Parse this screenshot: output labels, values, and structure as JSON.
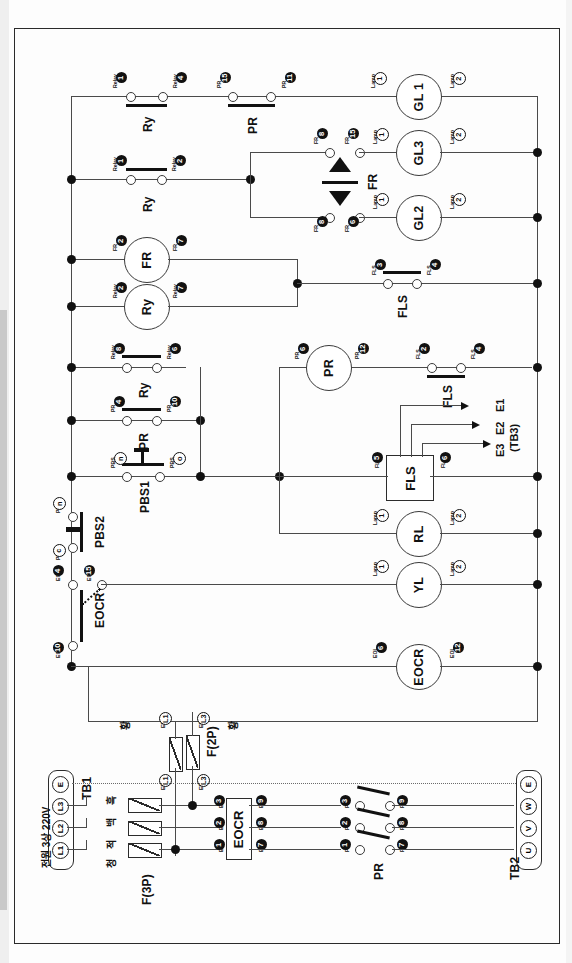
{
  "diagram": {
    "orientation": "page printed sideways (rotated 90 degrees)",
    "supply_label": "전원 3상 220V",
    "terminal_blocks": {
      "tb1": {
        "name": "TB1",
        "terminals": [
          "E",
          "L3",
          "L2",
          "L1"
        ]
      },
      "tb2": {
        "name": "TB2",
        "terminals": [
          "E",
          "W",
          "V",
          "U"
        ]
      },
      "tb3": {
        "name": "(TB3)",
        "electrodes": [
          "E1",
          "E2",
          "E3"
        ]
      }
    },
    "fuses": {
      "three_pole": {
        "label": "F(3P)",
        "wire_colors": [
          "흑",
          "백",
          "적",
          "청"
        ]
      },
      "two_pole": {
        "label": "F(2P)",
        "in_left": "EFin L1",
        "out_left": "EFout L1",
        "in_right": "EFin L3",
        "out_right": "EFout L3",
        "color_left": "황",
        "color_right": "황"
      }
    },
    "devices": {
      "eocr_box": "EOCR",
      "eocr_coil": "EOCR",
      "fls_box": "FLS",
      "pr_coil": "PR",
      "fr_coil": "FR",
      "ry_coil": "Ry",
      "rl_lamp": "RL",
      "yl_lamp": "YL",
      "gl1_lamp": "GL 1",
      "gl2_lamp": "GL2",
      "gl3_lamp": "GL3",
      "pbs1": "PBS1",
      "pbs2": "PBS2",
      "fr_flicker": "FR"
    },
    "rows": [
      {
        "id": "row-gl1",
        "contacts": [
          {
            "device": "Ry",
            "caption_a": "Relay",
            "num_a": "1",
            "caption_b": "Relay",
            "num_b": "4",
            "type": "nc"
          },
          {
            "device": "PR",
            "caption_a": "PR",
            "num_a": "15",
            "caption_b": "PR",
            "num_b": "11",
            "type": "nc"
          }
        ],
        "load": {
          "name": "GL 1",
          "cap_a": "Lamp",
          "num_a": "1",
          "cap_b": "Lamp",
          "num_b": "2"
        }
      },
      {
        "id": "row-gl3",
        "contacts": [
          {
            "device": "",
            "caption_a": "FR",
            "num_a": "8",
            "caption_b": "FR",
            "num_b": "15",
            "type": "no"
          }
        ],
        "load": {
          "name": "GL3",
          "cap_a": "Lamp",
          "num_a": "1",
          "cap_b": "Lamp",
          "num_b": "2"
        }
      },
      {
        "id": "row-gl2",
        "contacts": [
          {
            "device": "",
            "caption_a": "FR",
            "num_a": "8",
            "caption_b": "FR",
            "num_b": "6",
            "type": "no"
          }
        ],
        "load": {
          "name": "GL2",
          "cap_a": "Lamp",
          "num_a": "1",
          "cap_b": "Lamp",
          "num_b": "2"
        }
      },
      {
        "id": "row-ry-branch",
        "contacts": [
          {
            "device": "Ry",
            "caption_a": "Relay",
            "num_a": "1",
            "caption_b": "Relay",
            "num_b": "2",
            "type": "nc"
          }
        ],
        "load": null
      },
      {
        "id": "row-fr-coil",
        "load": {
          "name": "FR",
          "cap_a": "FR",
          "num_a": "2",
          "cap_b": "FR",
          "num_b": "7"
        }
      },
      {
        "id": "row-ry-coil",
        "load": {
          "name": "Ry",
          "cap_a": "Relay",
          "num_a": "2",
          "cap_b": "Relay",
          "num_b": "7"
        }
      },
      {
        "id": "row-fls-upper",
        "contacts": [
          {
            "device": "FLS",
            "caption_a": "FLS",
            "num_a": "3",
            "caption_b": "FLS",
            "num_b": "4",
            "type": "nc"
          }
        ]
      },
      {
        "id": "row-ry-contact",
        "contacts": [
          {
            "device": "Ry",
            "caption_a": "Relay",
            "num_a": "8",
            "caption_b": "Relay",
            "num_b": "6",
            "type": "no"
          }
        ]
      },
      {
        "id": "row-pr-contact",
        "contacts": [
          {
            "device": "PR",
            "caption_a": "PR",
            "num_a": "4",
            "caption_b": "PR",
            "num_b": "10",
            "type": "nc"
          }
        ]
      },
      {
        "id": "row-pbs1",
        "contacts": [
          {
            "device": "PBS1",
            "caption_a": "PBS",
            "num_a": "n",
            "caption_b": "PBS",
            "num_b": "o",
            "type": "nc-button"
          }
        ]
      },
      {
        "id": "row-pr-coil",
        "load": {
          "name": "PR",
          "cap_a": "PR",
          "num_a": "6",
          "cap_b": "PR",
          "num_b": "12"
        },
        "contacts": [
          {
            "device": "FLS",
            "caption_a": "FLS",
            "num_a": "2",
            "caption_b": "FLS",
            "num_b": "4",
            "type": "no"
          }
        ]
      },
      {
        "id": "row-fls-box",
        "box": {
          "name": "FLS",
          "cap_a": "FLS",
          "num_a": "5",
          "cap_b": "FLS",
          "num_b": "6"
        }
      },
      {
        "id": "row-pbs2",
        "contacts": [
          {
            "device": "PBS2",
            "caption_a": "PBS",
            "num_a": "n",
            "caption_b": "PBS",
            "num_b": "c",
            "type": "no-button"
          }
        ]
      },
      {
        "id": "row-rl",
        "load": {
          "name": "RL",
          "cap_a": "Lamp",
          "num_a": "1",
          "cap_b": "Lamp",
          "num_b": "2"
        }
      },
      {
        "id": "row-yl",
        "load": {
          "name": "YL",
          "cap_a": "Lamp",
          "num_a": "1",
          "cap_b": "Lamp",
          "num_b": "2"
        },
        "contacts": [
          {
            "device": "EOCR",
            "caption_a": "EOL",
            "num_a": "4",
            "caption_b": "EOL",
            "num_b": "15",
            "caption_c": "EOL",
            "num_c": "10",
            "type": "changeover"
          }
        ]
      },
      {
        "id": "row-eocr-coil",
        "load": {
          "name": "EOCR",
          "cap_a": "EOL",
          "num_a": "6",
          "cap_b": "EOL",
          "num_b": "12"
        }
      }
    ],
    "power_section": {
      "eocr_in_terminals": [
        {
          "cap": "EOL",
          "num": "3"
        },
        {
          "cap": "EOL",
          "num": "2"
        },
        {
          "cap": "EOL",
          "num": "1"
        }
      ],
      "eocr_out_terminals": [
        {
          "cap": "EOL",
          "num": "9"
        },
        {
          "cap": "EOL",
          "num": "8"
        },
        {
          "cap": "EOL",
          "num": "7"
        }
      ],
      "pr_in_terminals": [
        {
          "cap": "PR",
          "num": "3"
        },
        {
          "cap": "PR",
          "num": "2"
        },
        {
          "cap": "PR",
          "num": "1"
        }
      ],
      "pr_out_terminals": [
        {
          "cap": "PR",
          "num": "9"
        },
        {
          "cap": "PR",
          "num": "8"
        },
        {
          "cap": "PR",
          "num": "7"
        }
      ],
      "pr_label": "PR",
      "eocr_label": "EOCR"
    },
    "colors": {
      "wire": "#4a4a4a",
      "ink": "#111111",
      "paper": "#fdfdfd"
    }
  }
}
